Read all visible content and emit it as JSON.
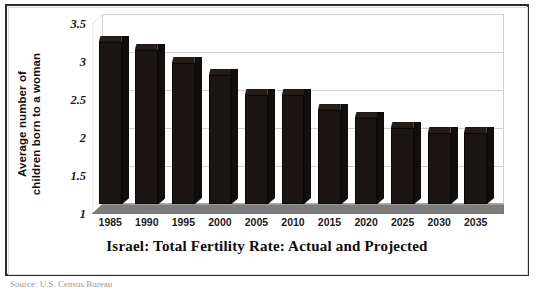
{
  "chart_data": {
    "type": "bar",
    "title": "Israel: Total Fertility Rate: Actual and Projected",
    "xlabel": "",
    "ylabel": "Average number of children born to a woman",
    "ylabel_lines": [
      "Average number of",
      "children born to a woman"
    ],
    "categories": [
      "1985",
      "1990",
      "1995",
      "2000",
      "2005",
      "2010",
      "2015",
      "2020",
      "2025",
      "2030",
      "2035"
    ],
    "values": [
      3.13,
      3.03,
      2.85,
      2.7,
      2.43,
      2.43,
      2.24,
      2.13,
      2.0,
      1.93,
      1.93
    ],
    "ylim": [
      1,
      3.5
    ],
    "yticks": [
      "3.5",
      "3",
      "2.5",
      "2",
      "1.5",
      "1"
    ],
    "ytick_values": [
      3.5,
      3,
      2.5,
      2,
      1.5,
      1
    ],
    "grid": true,
    "legend": false,
    "style": "3d-column",
    "bar_color": "#1b1613",
    "floor_color": "#808080",
    "grid_color": "#d0d0d0",
    "frame_color": "#2b2b2b"
  },
  "source_note": "Source: U.S. Census Bureau"
}
